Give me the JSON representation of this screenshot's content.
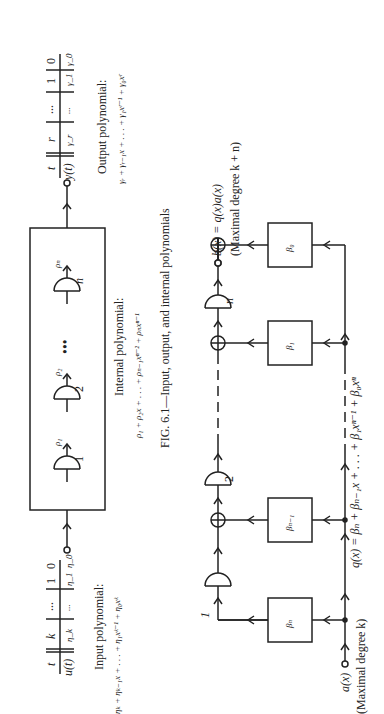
{
  "figure1": {
    "input_table": {
      "header": [
        "t",
        "k",
        "...",
        "1",
        "0"
      ],
      "row": [
        "u(t)",
        "η_k",
        "...",
        "η_1",
        "η_0"
      ]
    },
    "output_table": {
      "header": [
        "t",
        "r",
        "...",
        "1",
        "0"
      ],
      "row": [
        "y(t)",
        "γ_r",
        "...",
        "γ_1",
        "γ_0"
      ]
    },
    "delay_labels": [
      "1",
      "2",
      "n"
    ],
    "delay_outputs": [
      "ρ₁",
      "ρ₂",
      "ρₙ"
    ],
    "ellipsis": "•••",
    "input_label": "Input polynomial:",
    "input_formula": "ηₖ + ηₖ₋₁x + . . . + η₁xᵏ⁻¹ + η₀xᵏ",
    "internal_label": "Internal polynomial:",
    "internal_formula": "ρ₁ + ρ₂x + . . . + ρₙ₋₁xⁿ⁻² + ρₙxⁿ⁻¹",
    "output_label": "Output polynomial:",
    "output_formula": "γᵣ + γᵣ₋₁x + . . . + γ₁xʳ⁻¹ + γ₀xʳ",
    "caption": "FIG. 6.1—Input, output, and internal polynomials"
  },
  "figure2": {
    "input": "a(x)",
    "input_note": "(Maximal degree k)",
    "output": "b(x) = q(x)a(x)",
    "output_note": "(Maximal degree k + n)",
    "delay_labels": [
      "1",
      "2",
      "n"
    ],
    "multipliers": [
      "βₙ",
      "βₙ₋₁",
      "β₁",
      "β₀"
    ],
    "formula": "q(x) = βₙ + βₙ₋₁x + . . . + β₁xⁿ⁻¹ + β₀xⁿ"
  }
}
